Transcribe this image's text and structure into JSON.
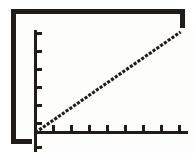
{
  "figure": {
    "background_color": "#ffffff",
    "frame_color": "#211b1a",
    "plot_background_color": "#fdfdfc",
    "ink_color": "#211b1a"
  },
  "chart_data": {
    "type": "line",
    "title": "",
    "subtitle": "",
    "xlabel": "",
    "ylabel": "",
    "series": [
      {
        "name": "linear-trend",
        "style": "dotted",
        "color": "#211b1a",
        "x": [
          0,
          1,
          2,
          3,
          4,
          5,
          6,
          7,
          8
        ],
        "y": [
          0,
          0.75,
          1.5,
          2.25,
          3.0,
          3.75,
          4.5,
          5.25,
          6.0
        ]
      }
    ],
    "x": [
      0,
      1,
      2,
      3,
      4,
      5,
      6,
      7,
      8
    ],
    "xlim": [
      0,
      8.6
    ],
    "ylim": [
      -0.9,
      6.6
    ],
    "xticks": [
      1,
      2,
      3,
      4,
      5,
      6,
      7,
      8
    ],
    "xticklabels": [
      "",
      "",
      "",
      "",
      "",
      "",
      "",
      ""
    ],
    "yticks": [
      -0.9,
      1,
      2,
      3,
      4,
      5,
      6
    ],
    "yticklabels": [
      "",
      "",
      "",
      "",
      "",
      "",
      ""
    ],
    "grid": false,
    "legend": false,
    "legend_position": "none",
    "annotations": []
  },
  "axes": {
    "y_axis_name": "vertical-axis",
    "x_axis_name": "horizontal-axis",
    "y_tick_positions_px": [
      4,
      22,
      40,
      58,
      76,
      94,
      118
    ],
    "x_tick_positions_px": [
      20,
      38,
      56,
      74,
      92,
      110,
      128,
      146
    ]
  }
}
